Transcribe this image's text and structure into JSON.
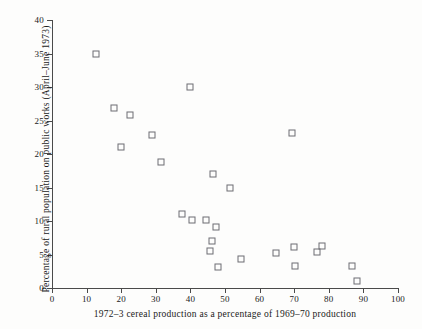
{
  "chart_data": {
    "type": "scatter",
    "title": "",
    "xlabel": "1972–3 cereal production as a percentage of 1969–70 production",
    "ylabel": "Percentage of rural population on public works (April–June 1973)",
    "xlim": [
      0,
      100
    ],
    "ylim": [
      0,
      40
    ],
    "xticks": [
      0,
      10,
      20,
      30,
      40,
      50,
      60,
      70,
      80,
      90,
      100
    ],
    "yticks": [
      0,
      5,
      10,
      15,
      20,
      25,
      30,
      35,
      40
    ],
    "grid": false,
    "legend": null,
    "marker": "open-square",
    "marker_color": "#6d6d72",
    "series": [
      {
        "name": "districts",
        "points": [
          [
            12.7,
            35.0
          ],
          [
            17.9,
            26.9
          ],
          [
            19.9,
            21.0
          ],
          [
            22.5,
            25.8
          ],
          [
            28.9,
            22.8
          ],
          [
            31.5,
            18.8
          ],
          [
            39.9,
            30.0
          ],
          [
            37.6,
            11.0
          ],
          [
            40.5,
            10.2
          ],
          [
            44.6,
            10.2
          ],
          [
            46.5,
            17.0
          ],
          [
            47.4,
            9.1
          ],
          [
            46.2,
            7.0
          ],
          [
            45.6,
            5.5
          ],
          [
            47.9,
            3.2
          ],
          [
            51.5,
            15.0
          ],
          [
            54.5,
            4.3
          ],
          [
            64.8,
            5.2
          ],
          [
            69.4,
            23.1
          ],
          [
            70.0,
            6.1
          ],
          [
            70.3,
            3.3
          ],
          [
            76.6,
            5.3
          ],
          [
            78.0,
            6.2
          ],
          [
            86.7,
            3.3
          ],
          [
            88.1,
            1.0
          ]
        ]
      }
    ]
  },
  "axes": {
    "x_tick_labels": [
      "0",
      "10",
      "20",
      "30",
      "40",
      "50",
      "60",
      "70",
      "80",
      "90",
      "100"
    ],
    "y_tick_labels": [
      "0",
      "5",
      "10",
      "15",
      "20",
      "25",
      "30",
      "35",
      "40"
    ]
  }
}
